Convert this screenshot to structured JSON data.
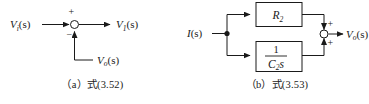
{
  "figure": {
    "background_color": "#ffffff",
    "line_color": "#1a1a1a"
  },
  "panel_a": {
    "caption": "（a）式(3.52)",
    "input_label": {
      "symbol": "V",
      "subscript": "i",
      "arg": "(s)"
    },
    "output_label": {
      "symbol": "V",
      "subscript": "1",
      "arg": "(s)"
    },
    "feedback_label": {
      "symbol": "V",
      "subscript": "o",
      "arg": "(s)"
    },
    "summing_junction": {
      "name": "summing-junction",
      "sign_top": "+",
      "sign_bottom": "−"
    }
  },
  "panel_b": {
    "caption": "（b）式(3.53)",
    "input_label": {
      "symbol": "I",
      "subscript": "",
      "arg": "(s)"
    },
    "output_label": {
      "symbol": "V",
      "subscript": "o",
      "arg": "(s)"
    },
    "block_top": {
      "symbol": "R",
      "subscript": "2"
    },
    "block_bottom": {
      "numerator": "1",
      "denominator_symbol": "C",
      "denominator_subscript": "2",
      "denominator_var": "s"
    },
    "summing_junction": {
      "name": "summing-junction",
      "sign_top": "+",
      "sign_bottom": "+"
    }
  }
}
